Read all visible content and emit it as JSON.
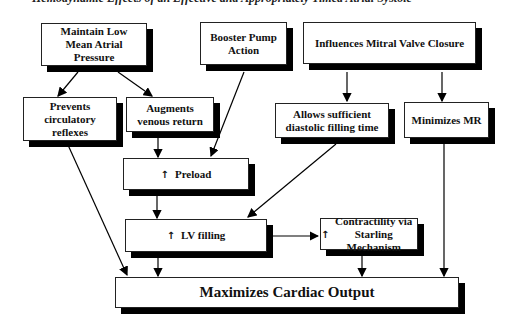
{
  "title": "Hemodynamic Effects of an Effective and Appropriately Timed Atrial Systole",
  "nodes": {
    "maintain": "Maintain Low Mean Atrial Pressure",
    "booster": "Booster Pump Action",
    "mitral": "Influences Mitral Valve Closure",
    "prevents": "Prevents circulatory reflexes",
    "augments": "Augments venous return",
    "allows": "Allows sufficient diastolic filling time",
    "minimizes": "Minimizes MR",
    "preload": "Preload",
    "lvfilling": "LV filling",
    "contractility": "Contractility via Starling Mechanism",
    "output": "Maximizes Cardiac Output"
  },
  "icons": {
    "increase": "↑"
  },
  "edges": [
    [
      "maintain",
      "prevents"
    ],
    [
      "maintain",
      "augments"
    ],
    [
      "booster",
      "preload"
    ],
    [
      "mitral",
      "allows"
    ],
    [
      "mitral",
      "minimizes"
    ],
    [
      "augments",
      "preload"
    ],
    [
      "prevents",
      "output"
    ],
    [
      "preload",
      "lvfilling"
    ],
    [
      "allows",
      "lvfilling"
    ],
    [
      "lvfilling",
      "contractility"
    ],
    [
      "lvfilling",
      "output"
    ],
    [
      "contractility",
      "output"
    ],
    [
      "minimizes",
      "output"
    ]
  ]
}
